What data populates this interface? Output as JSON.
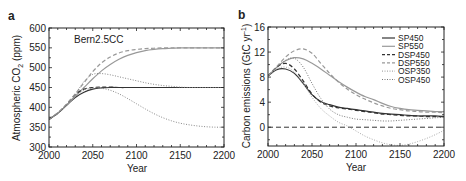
{
  "chart_data": [
    {
      "panel": "a",
      "type": "line",
      "title": "",
      "annotation": "Bern2.5CC",
      "xlabel": "Year",
      "ylabel": "Atmospheric CO2 (ppm)",
      "xlim": [
        2000,
        2200
      ],
      "ylim": [
        300,
        600
      ],
      "xticks": [
        2000,
        2050,
        2100,
        2150,
        2200
      ],
      "yticks": [
        300,
        350,
        400,
        450,
        500,
        550,
        600
      ],
      "grid": false,
      "x": [
        2000,
        2010,
        2020,
        2030,
        2040,
        2050,
        2060,
        2070,
        2080,
        2090,
        2100,
        2110,
        2120,
        2130,
        2140,
        2150,
        2160,
        2170,
        2180,
        2190,
        2200
      ],
      "series": [
        {
          "name": "SP450",
          "style": "solid",
          "color": "#333333",
          "values": [
            370,
            385,
            405,
            425,
            438,
            446,
            449,
            450,
            450,
            450,
            450,
            450,
            450,
            450,
            450,
            450,
            450,
            450,
            450,
            450,
            450
          ]
        },
        {
          "name": "SP550",
          "style": "solid",
          "color": "#999999",
          "values": [
            370,
            385,
            405,
            428,
            450,
            472,
            492,
            508,
            521,
            531,
            538,
            543,
            546,
            548,
            549,
            550,
            550,
            550,
            550,
            550,
            550
          ]
        },
        {
          "name": "DSP450",
          "style": "dashed",
          "color": "#333333",
          "values": [
            370,
            385,
            407,
            432,
            446,
            450,
            451,
            451,
            450,
            450,
            450,
            450,
            450,
            450,
            450,
            450,
            450,
            450,
            450,
            450,
            450
          ]
        },
        {
          "name": "DSP550",
          "style": "dashed",
          "color": "#999999",
          "values": [
            370,
            386,
            408,
            434,
            462,
            490,
            512,
            527,
            537,
            543,
            546,
            548,
            549,
            550,
            550,
            550,
            550,
            550,
            550,
            550,
            550
          ]
        },
        {
          "name": "OSP350",
          "style": "dotted",
          "color": "#888888",
          "values": [
            370,
            385,
            406,
            428,
            443,
            449,
            448,
            443,
            434,
            422,
            409,
            396,
            384,
            374,
            366,
            360,
            356,
            353,
            351,
            350,
            350
          ]
        },
        {
          "name": "OSP450",
          "style": "dotted",
          "color": "#888888",
          "values": [
            370,
            385,
            406,
            432,
            465,
            483,
            485,
            482,
            477,
            472,
            467,
            462,
            458,
            455,
            453,
            451,
            450,
            450,
            450,
            450,
            450
          ]
        }
      ]
    },
    {
      "panel": "b",
      "type": "line",
      "title": "",
      "xlabel": "Year",
      "ylabel": "Carbon emissions (GtC yr-1)",
      "xlim": [
        2000,
        2200
      ],
      "ylim": [
        -3,
        16
      ],
      "xticks": [
        2000,
        2050,
        2100,
        2150,
        2200
      ],
      "yticks": [
        0,
        4,
        8,
        12,
        16
      ],
      "grid": false,
      "reference_line": {
        "y": 0,
        "style": "dashed"
      },
      "legend_position": "upper right",
      "x": [
        2000,
        2010,
        2020,
        2030,
        2040,
        2050,
        2060,
        2070,
        2080,
        2090,
        2100,
        2110,
        2120,
        2130,
        2140,
        2150,
        2160,
        2170,
        2180,
        2190,
        2200
      ],
      "series": [
        {
          "name": "SP450",
          "style": "solid",
          "color": "#333333",
          "values": [
            8.2,
            9.2,
            9.3,
            8.6,
            7.0,
            5.2,
            4.1,
            3.6,
            3.2,
            3.0,
            2.8,
            2.6,
            2.4,
            2.2,
            2.1,
            2.0,
            1.9,
            1.8,
            1.8,
            1.8,
            1.7
          ]
        },
        {
          "name": "SP550",
          "style": "solid",
          "color": "#999999",
          "values": [
            8.2,
            9.6,
            10.6,
            11.1,
            10.9,
            10.2,
            9.3,
            8.3,
            7.3,
            6.4,
            5.6,
            4.9,
            4.4,
            3.8,
            3.3,
            3.0,
            2.8,
            2.7,
            2.6,
            2.5,
            2.5
          ]
        },
        {
          "name": "DSP450",
          "style": "dashed",
          "color": "#333333",
          "values": [
            8.2,
            9.6,
            10.2,
            9.3,
            7.4,
            5.3,
            4.0,
            3.4,
            3.1,
            2.9,
            2.7,
            2.5,
            2.3,
            2.1,
            2.0,
            1.9,
            1.8,
            1.8,
            1.7,
            1.7,
            1.7
          ]
        },
        {
          "name": "DSP550",
          "style": "dashed",
          "color": "#999999",
          "values": [
            8.2,
            9.7,
            11.2,
            12.2,
            12.5,
            11.8,
            10.2,
            8.6,
            7.2,
            6.1,
            5.2,
            4.5,
            3.9,
            3.4,
            3.0,
            2.8,
            2.6,
            2.5,
            2.4,
            2.4,
            2.3
          ]
        },
        {
          "name": "OSP350",
          "style": "dotted",
          "color": "#aaaaaa",
          "values": [
            8.2,
            9.3,
            9.6,
            8.8,
            7.0,
            4.8,
            3.0,
            1.8,
            0.8,
            0.2,
            -0.6,
            -1.4,
            -2.0,
            -2.5,
            -2.8,
            -2.9,
            -2.7,
            -2.3,
            -1.8,
            -1.2,
            -0.5
          ]
        },
        {
          "name": "OSP450",
          "style": "dotted",
          "color": "#777777",
          "values": [
            8.2,
            9.5,
            10.7,
            11.0,
            9.6,
            7.0,
            4.6,
            2.9,
            2.0,
            1.6,
            1.3,
            1.2,
            1.1,
            1.0,
            1.0,
            1.1,
            1.2,
            1.3,
            1.4,
            1.5,
            1.6
          ]
        }
      ]
    }
  ],
  "panels": {
    "a": {
      "label": "a",
      "annotation": "Bern2.5CC",
      "xlabel": "Year",
      "ylabel_main": "Atmospheric CO",
      "ylabel_sub": "2",
      "ylabel_unit": " (ppm)"
    },
    "b": {
      "label": "b",
      "xlabel": "Year",
      "ylabel_main": "Carbon emissions (GtC yr",
      "ylabel_sup": "-1",
      "ylabel_end": ")"
    }
  }
}
